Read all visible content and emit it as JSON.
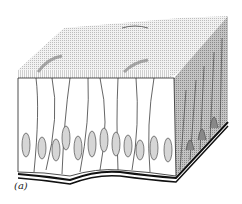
{
  "figure": {
    "panel_label": "(a)",
    "colors": {
      "background": "#ffffff",
      "outline": "#222222",
      "surface_stipple": "#d8d8d8",
      "side_shade": "#a9a9a9",
      "nucleus_fill": "#cfcfcf",
      "basement_membrane": "#111111"
    }
  }
}
